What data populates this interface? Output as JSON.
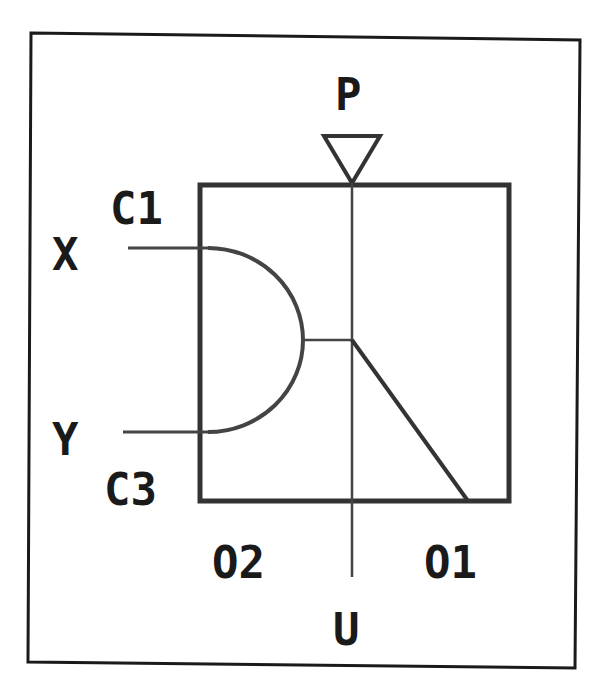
{
  "diagram": {
    "colors": {
      "line": "#1a1a1a",
      "background": "#ffffff"
    },
    "labels": {
      "P": "P",
      "C1": "C1",
      "X": "X",
      "Y": "Y",
      "C3": "C3",
      "O2": "O2",
      "O1": "O1",
      "U": "U"
    },
    "components": [
      {
        "id": "outer-frame",
        "type": "rectangle"
      },
      {
        "id": "inner-box",
        "type": "rectangle"
      },
      {
        "id": "input-triangle",
        "type": "triangle",
        "label": "P"
      },
      {
        "id": "and-gate-arc",
        "type": "semicircle",
        "inputs": [
          "X",
          "Y"
        ]
      },
      {
        "id": "vertical-line",
        "type": "line",
        "from": "P",
        "to": "U"
      },
      {
        "id": "diagonal-line",
        "type": "line",
        "to": "O1"
      }
    ]
  }
}
